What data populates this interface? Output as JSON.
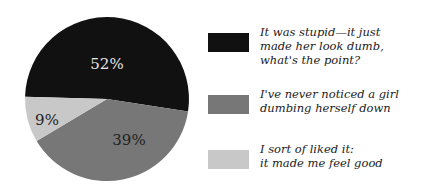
{
  "chart_data": {
    "type": "pie",
    "title": "",
    "categories": [
      "It was stupid—it just made her look dumb, what's the point?",
      "I've never noticed a girl dumbing herself down",
      "I sort of liked it: it made me feel good"
    ],
    "values": [
      52,
      39,
      9
    ],
    "labels": [
      "52%",
      "39%",
      "9%"
    ],
    "colors": [
      "#111111",
      "#777777",
      "#c8c8c8"
    ],
    "label_colors": [
      "#e6e6e6",
      "#222222",
      "#222222"
    ],
    "legend_position": "right"
  },
  "legend": {
    "items": [
      {
        "text": "It was stupid—it just\nmade her look dumb,\nwhat's the point?",
        "color": "#111111"
      },
      {
        "text": "I've never noticed a girl\ndumbing herself down",
        "color": "#777777"
      },
      {
        "text": "I sort of liked it:\nit made me feel good",
        "color": "#c8c8c8"
      }
    ]
  }
}
